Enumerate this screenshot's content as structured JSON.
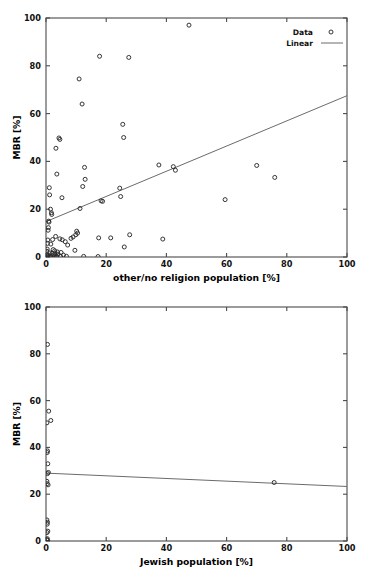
{
  "figure": {
    "background": "#ffffff",
    "marker_color": "#2b2b2b",
    "line_color": "#6b6b6b",
    "axis_color": "#4a4a4a"
  },
  "chart_data": [
    {
      "id": "top",
      "type": "scatter",
      "title": "",
      "xlabel": "other/no religion population [%]",
      "ylabel": "MBR [%]",
      "xlim": [
        0,
        100
      ],
      "ylim": [
        0,
        100
      ],
      "xticks": [
        0,
        20,
        40,
        60,
        80,
        100
      ],
      "xticklabels": [
        "0",
        "20",
        "40",
        "60",
        "80",
        "100"
      ],
      "yticks": [
        0,
        20,
        40,
        60,
        80,
        100
      ],
      "yticklabels": [
        "0",
        "20",
        "40",
        "60",
        "80",
        "100"
      ],
      "grid": false,
      "legend_position": "top-right",
      "legend": [
        {
          "label": "Data",
          "kind": "marker"
        },
        {
          "label": "Linear",
          "kind": "line"
        }
      ],
      "series": [
        {
          "name": "Data",
          "kind": "scatter",
          "points": [
            [
              47.5,
              97.0
            ],
            [
              17.8,
              84.0
            ],
            [
              27.5,
              83.5
            ],
            [
              11.0,
              74.5
            ],
            [
              12.0,
              64.0
            ],
            [
              25.5,
              55.5
            ],
            [
              4.3,
              49.8
            ],
            [
              4.6,
              49.2
            ],
            [
              25.8,
              50.0
            ],
            [
              3.3,
              45.5
            ],
            [
              37.5,
              38.5
            ],
            [
              42.3,
              37.8
            ],
            [
              70.0,
              38.3
            ],
            [
              12.8,
              37.5
            ],
            [
              43.0,
              36.3
            ],
            [
              3.6,
              34.7
            ],
            [
              76.0,
              33.3
            ],
            [
              13.0,
              32.5
            ],
            [
              12.2,
              29.5
            ],
            [
              24.5,
              28.8
            ],
            [
              1.1,
              29.0
            ],
            [
              1.2,
              26.0
            ],
            [
              5.3,
              24.8
            ],
            [
              24.8,
              25.3
            ],
            [
              59.5,
              24.0
            ],
            [
              18.3,
              23.5
            ],
            [
              18.8,
              23.3
            ],
            [
              1.5,
              20.0
            ],
            [
              11.3,
              20.3
            ],
            [
              1.8,
              18.5
            ],
            [
              1.9,
              17.8
            ],
            [
              0.9,
              15.0
            ],
            [
              1.0,
              14.6
            ],
            [
              0.8,
              12.3
            ],
            [
              0.7,
              11.2
            ],
            [
              10.2,
              10.8
            ],
            [
              10.5,
              10.0
            ],
            [
              9.9,
              9.3
            ],
            [
              27.8,
              9.3
            ],
            [
              3.2,
              8.6
            ],
            [
              17.5,
              8.0
            ],
            [
              21.5,
              8.0
            ],
            [
              38.8,
              7.5
            ],
            [
              2.2,
              7.3
            ],
            [
              0.6,
              7.1
            ],
            [
              4.6,
              7.6
            ],
            [
              5.4,
              7.2
            ],
            [
              8.3,
              7.8
            ],
            [
              9.0,
              8.4
            ],
            [
              6.4,
              6.4
            ],
            [
              0.5,
              5.7
            ],
            [
              1.6,
              5.4
            ],
            [
              7.2,
              5.0
            ],
            [
              26.0,
              4.2
            ],
            [
              0.4,
              3.3
            ],
            [
              2.4,
              3.1
            ],
            [
              9.6,
              2.8
            ],
            [
              2.9,
              2.6
            ],
            [
              0.3,
              2.4
            ],
            [
              3.8,
              2.1
            ],
            [
              5.0,
              1.9
            ],
            [
              1.3,
              1.7
            ],
            [
              2.0,
              1.5
            ],
            [
              3.0,
              1.3
            ],
            [
              4.0,
              1.2
            ],
            [
              0.2,
              1.0
            ],
            [
              2.6,
              0.9
            ],
            [
              5.8,
              0.8
            ],
            [
              1.4,
              0.6
            ],
            [
              0.6,
              0.5
            ],
            [
              3.4,
              0.4
            ],
            [
              4.8,
              0.3
            ],
            [
              2.8,
              0.25
            ],
            [
              0.9,
              0.2
            ],
            [
              6.8,
              0.3
            ],
            [
              12.5,
              0.25
            ],
            [
              17.3,
              0.2
            ],
            [
              1.7,
              0.15
            ],
            [
              3.6,
              0.1
            ],
            [
              0.35,
              0.05
            ]
          ]
        },
        {
          "name": "Linear",
          "kind": "line",
          "endpoints": [
            [
              0,
              14.8
            ],
            [
              100,
              67.5
            ]
          ]
        }
      ]
    },
    {
      "id": "bottom",
      "type": "scatter",
      "title": "",
      "xlabel": "Jewish population [%]",
      "ylabel": "MBR [%]",
      "xlim": [
        0,
        100
      ],
      "ylim": [
        0,
        100
      ],
      "xticks": [
        0,
        20,
        40,
        60,
        80,
        100
      ],
      "xticklabels": [
        "0",
        "20",
        "40",
        "60",
        "80",
        "100"
      ],
      "yticks": [
        0,
        20,
        40,
        60,
        80,
        100
      ],
      "yticklabels": [
        "0",
        "20",
        "40",
        "60",
        "80",
        "100"
      ],
      "grid": false,
      "legend_position": "none",
      "legend": [],
      "series": [
        {
          "name": "Data",
          "kind": "scatter",
          "points": [
            [
              0.5,
              84.0
            ],
            [
              0.9,
              55.5
            ],
            [
              0.3,
              50.5
            ],
            [
              1.6,
              51.5
            ],
            [
              0.5,
              38.5
            ],
            [
              0.4,
              37.8
            ],
            [
              0.6,
              33.0
            ],
            [
              0.8,
              29.3
            ],
            [
              0.5,
              28.8
            ],
            [
              0.3,
              25.5
            ],
            [
              0.4,
              24.5
            ],
            [
              0.7,
              24.0
            ],
            [
              75.8,
              25.0
            ],
            [
              0.3,
              9.0
            ],
            [
              0.5,
              8.0
            ],
            [
              0.4,
              7.2
            ],
            [
              0.6,
              4.2
            ],
            [
              0.35,
              3.6
            ],
            [
              0.45,
              1.0
            ],
            [
              0.25,
              0.6
            ],
            [
              0.55,
              0.3
            ]
          ]
        },
        {
          "name": "Linear",
          "kind": "line",
          "endpoints": [
            [
              0,
              29.0
            ],
            [
              100,
              23.3
            ]
          ]
        }
      ]
    }
  ]
}
